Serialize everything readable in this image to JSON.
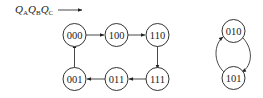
{
  "diagram": {
    "type": "state-transition",
    "label": {
      "base": "Q",
      "subscripts": [
        "A",
        "B",
        "C"
      ]
    },
    "cycle_main": {
      "states": [
        "000",
        "100",
        "110",
        "111",
        "011",
        "001"
      ],
      "transitions": [
        {
          "from": "000",
          "to": "100"
        },
        {
          "from": "100",
          "to": "110"
        },
        {
          "from": "110",
          "to": "111"
        },
        {
          "from": "111",
          "to": "011"
        },
        {
          "from": "011",
          "to": "001"
        },
        {
          "from": "001",
          "to": "000"
        }
      ]
    },
    "cycle_invalid": {
      "states": [
        "010",
        "101"
      ],
      "transitions": [
        {
          "from": "010",
          "to": "101"
        },
        {
          "from": "101",
          "to": "010"
        }
      ]
    },
    "nodes": {
      "n000": "000",
      "n100": "100",
      "n110": "110",
      "n111": "111",
      "n011": "011",
      "n001": "001",
      "n010": "010",
      "n101": "101"
    },
    "colors": {
      "stroke": "#333333",
      "text": "#222222",
      "background": "#ffffff"
    }
  }
}
